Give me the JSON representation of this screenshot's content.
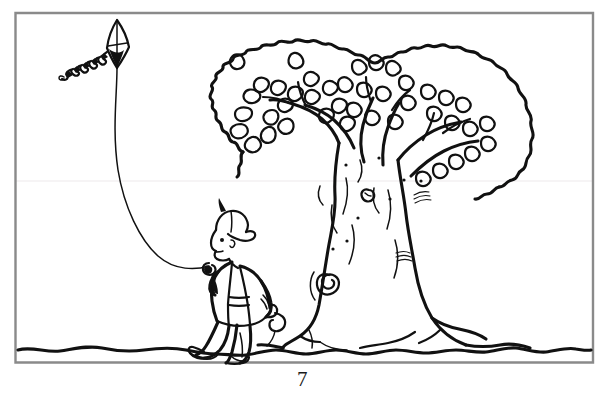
{
  "document": {
    "type": "coloring-book-page",
    "page_number": "7",
    "style": "black-and-white line art",
    "background_color": "#ffffff",
    "ink_color": "#111111",
    "frame_color": "#8a8a8a"
  },
  "illustration": {
    "title": "Boy flying a kite beside a large tree",
    "scene_elements": [
      "kite",
      "kite-string",
      "boy",
      "tree",
      "ground-line"
    ],
    "kite": {
      "name": "diamond kite",
      "tail_description": "zigzag tail with bow knots trailing to the left",
      "position": {
        "x": 115,
        "y": 45
      }
    },
    "boy": {
      "name": "boy flying kite",
      "clothing": [
        "baseball cap",
        "open vest",
        "t-shirt",
        "long pants",
        "sneakers"
      ],
      "position": {
        "x": 228,
        "y": 280
      }
    },
    "tree": {
      "name": "large leafy tree",
      "features": [
        "scalloped canopy outline",
        "leaf clusters",
        "thick forked trunk",
        "knot holes",
        "spreading surface roots"
      ],
      "position": {
        "x": 380,
        "y": 190
      }
    },
    "ground": {
      "name": "wavy ground line",
      "y": 350
    }
  },
  "page_footer": {
    "number_label": "7"
  }
}
